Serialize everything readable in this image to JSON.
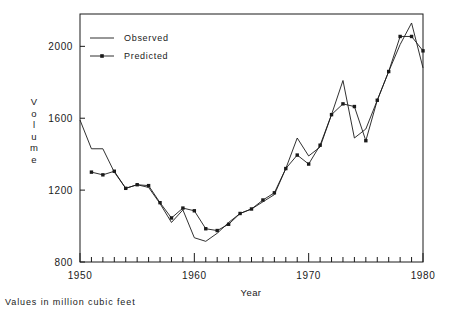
{
  "figure": {
    "footnote": "Values in million cubic feet",
    "y_axis_title_letters": [
      "V",
      "o",
      "l",
      "u",
      "m",
      "e"
    ]
  },
  "chart_data": {
    "type": "line",
    "title": "",
    "xlabel": "Year",
    "ylabel": "Volume",
    "xlim": [
      1950,
      1980
    ],
    "ylim": [
      800,
      2180
    ],
    "xticks": [
      1950,
      1960,
      1970,
      1980
    ],
    "xtick_labels": [
      "1950",
      "1960",
      "1970",
      "1980"
    ],
    "yticks": [
      800,
      1200,
      1600,
      2000
    ],
    "ytick_labels": [
      "800",
      "1200",
      "1600",
      "2000"
    ],
    "minor_xtick_interval": 1,
    "grid": false,
    "legend_position": "top-left-inside",
    "frame": "box",
    "units_note": "Values in million cubic feet",
    "x": [
      1950,
      1951,
      1952,
      1953,
      1954,
      1955,
      1956,
      1957,
      1958,
      1959,
      1960,
      1961,
      1962,
      1963,
      1964,
      1965,
      1966,
      1967,
      1968,
      1969,
      1970,
      1971,
      1972,
      1973,
      1974,
      1975,
      1976,
      1977,
      1978,
      1979,
      1980
    ],
    "series": [
      {
        "name": "Observed",
        "marker": "none",
        "line_style": "solid",
        "color": "#1a1a1a",
        "values": [
          1590,
          1430,
          1430,
          1300,
          1210,
          1230,
          1215,
          1125,
          1020,
          1090,
          935,
          915,
          960,
          1020,
          1070,
          1095,
          1135,
          1175,
          1320,
          1490,
          1390,
          1440,
          1620,
          1810,
          1490,
          1540,
          1700,
          1860,
          2010,
          2130,
          1880
        ]
      },
      {
        "name": "Predicted",
        "marker": "square",
        "line_style": "solid",
        "color": "#1a1a1a",
        "values": [
          null,
          1300,
          1285,
          1305,
          1210,
          1230,
          1225,
          1130,
          1045,
          1100,
          1085,
          985,
          975,
          1010,
          1070,
          1095,
          1145,
          1185,
          1320,
          1395,
          1345,
          1450,
          1620,
          1680,
          1665,
          1475,
          1700,
          1860,
          2055,
          2055,
          1975
        ]
      }
    ],
    "legend": [
      {
        "label": "Observed",
        "marker": "none"
      },
      {
        "label": "Predicted",
        "marker": "square"
      }
    ]
  }
}
